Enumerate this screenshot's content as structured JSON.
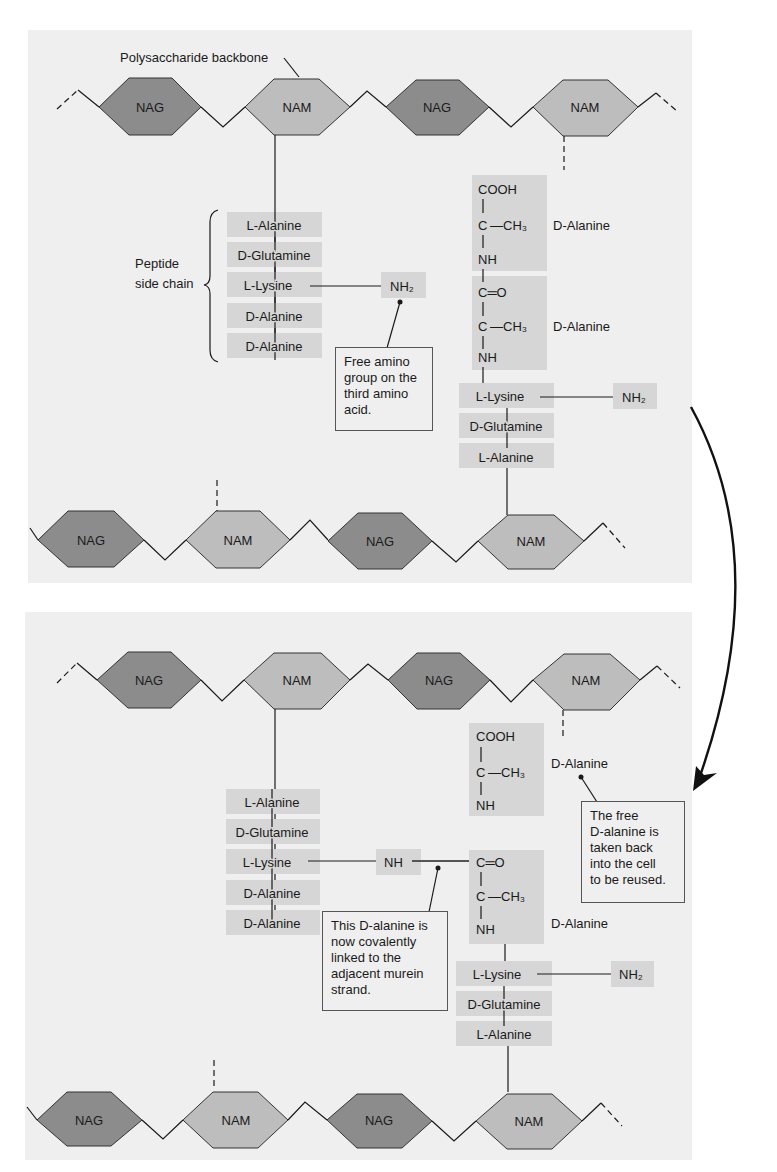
{
  "colors": {
    "panel_bg": "#efefef",
    "nag_fill": "#8c8c8c",
    "nam_fill": "#bdbdbd",
    "amino_box": "#d6d6d6",
    "line": "#1a1a1a"
  },
  "top_panel": {
    "backbone_label": "Polysaccharide backbone",
    "upper_chain": [
      "NAG",
      "NAM",
      "NAG",
      "NAM"
    ],
    "lower_chain": [
      "NAG",
      "NAM",
      "NAG",
      "NAM"
    ],
    "side_chain_label": "Peptide\nside chain",
    "left_peptide": [
      "L-Alanine",
      "D-Glutamine",
      "L-Lysine",
      "D-Alanine",
      "D-Alanine"
    ],
    "left_amino": "NH₂",
    "callout": "Free amino\ngroup on the\nthird amino\nacid.",
    "right_chem": {
      "cooh": "COOH",
      "c1": "C",
      "ch3_1": "—CH₃",
      "nh1": "NH",
      "co": "C═O",
      "c2": "C",
      "ch3_2": "—CH₃",
      "nh2": "NH",
      "label1": "D-Alanine",
      "label2": "D-Alanine"
    },
    "right_peptide": [
      "L-Lysine",
      "D-Glutamine",
      "L-Alanine"
    ],
    "right_amino": "NH₂"
  },
  "bottom_panel": {
    "upper_chain": [
      "NAG",
      "NAM",
      "NAG",
      "NAM"
    ],
    "lower_chain": [
      "NAG",
      "NAM",
      "NAG",
      "NAM"
    ],
    "left_peptide": [
      "L-Alanine",
      "D-Glutamine",
      "L-Lysine",
      "D-Alanine",
      "D-Alanine"
    ],
    "left_nh": "NH",
    "free_chem": {
      "cooh": "COOH",
      "c": "C",
      "ch3": "—CH₃",
      "nh": "NH",
      "label": "D-Alanine"
    },
    "free_callout": "The free\nD-alanine is\ntaken back\ninto the cell\nto be reused.",
    "linked_chem": {
      "co": "C═O",
      "c": "C",
      "ch3": "—CH₃",
      "nh": "NH",
      "label": "D-Alanine"
    },
    "linked_callout": "This D-alanine is\nnow covalently\nlinked to the\nadjacent murein\nstrand.",
    "right_peptide": [
      "L-Lysine",
      "D-Glutamine",
      "L-Alanine"
    ],
    "right_amino": "NH₂"
  }
}
